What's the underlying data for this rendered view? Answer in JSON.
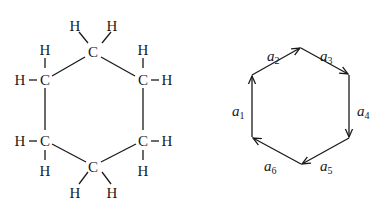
{
  "molecule": {
    "name": "cyclohexane structural formula",
    "carbon_symbol": "C",
    "hydrogen_symbol": "H",
    "carbons": [
      {
        "id": "c_top",
        "label": "C",
        "x": 93,
        "y": 52
      },
      {
        "id": "c_upper_right",
        "label": "C",
        "x": 143,
        "y": 80
      },
      {
        "id": "c_lower_right",
        "label": "C",
        "x": 143,
        "y": 141
      },
      {
        "id": "c_bottom",
        "label": "C",
        "x": 93,
        "y": 168
      },
      {
        "id": "c_lower_left",
        "label": "C",
        "x": 45,
        "y": 141
      },
      {
        "id": "c_upper_left",
        "label": "C",
        "x": 45,
        "y": 80
      }
    ],
    "hydrogens": [
      {
        "label": "H",
        "x": 75,
        "y": 26
      },
      {
        "label": "H",
        "x": 112,
        "y": 26
      },
      {
        "label": "H",
        "x": 143,
        "y": 50
      },
      {
        "label": "H",
        "x": 167,
        "y": 84
      },
      {
        "label": "H",
        "x": 167,
        "y": 145
      },
      {
        "label": "H",
        "x": 143,
        "y": 174
      },
      {
        "label": "H",
        "x": 75,
        "y": 196
      },
      {
        "label": "H",
        "x": 112,
        "y": 196
      },
      {
        "label": "H",
        "x": 45,
        "y": 174
      },
      {
        "label": "H",
        "x": 20,
        "y": 145
      },
      {
        "label": "H",
        "x": 20,
        "y": 84
      },
      {
        "label": "H",
        "x": 45,
        "y": 50
      }
    ]
  },
  "graph": {
    "name": "directed hexagon",
    "vertices": [
      {
        "x": 252,
        "y": 75
      },
      {
        "x": 301,
        "y": 48
      },
      {
        "x": 349,
        "y": 75
      },
      {
        "x": 349,
        "y": 138
      },
      {
        "x": 301,
        "y": 164
      },
      {
        "x": 252,
        "y": 137
      }
    ],
    "edges": [
      {
        "base": "a",
        "sub": "1",
        "from": 5,
        "to": 0,
        "lx": 232,
        "ly": 112
      },
      {
        "base": "a",
        "sub": "2",
        "from": 0,
        "to": 1,
        "lx": 267,
        "ly": 57
      },
      {
        "base": "a",
        "sub": "3",
        "from": 1,
        "to": 2,
        "lx": 320,
        "ly": 57
      },
      {
        "base": "a",
        "sub": "4",
        "from": 2,
        "to": 3,
        "lx": 357,
        "ly": 112
      },
      {
        "base": "a",
        "sub": "5",
        "from": 3,
        "to": 4,
        "lx": 320,
        "ly": 167
      },
      {
        "base": "a",
        "sub": "6",
        "from": 4,
        "to": 5,
        "lx": 265,
        "ly": 167
      }
    ]
  }
}
